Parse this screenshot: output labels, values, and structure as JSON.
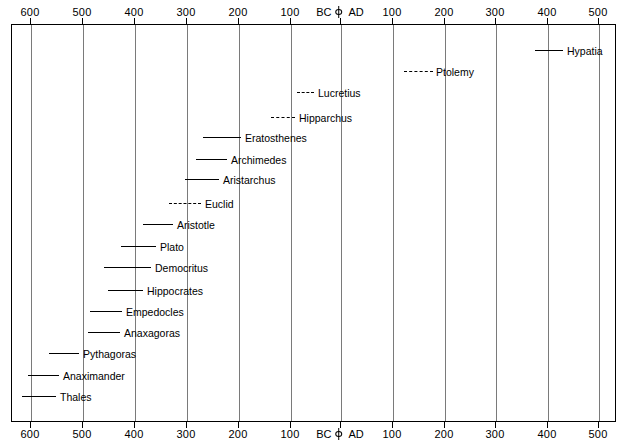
{
  "chart_data": {
    "type": "bar",
    "subtitle": "",
    "xlabel": "",
    "ylabel": "",
    "grid": true,
    "legend": "none",
    "orientation": "horizontal",
    "era_labels": {
      "bc": "BC",
      "ad": "AD",
      "origin_glyph": "origin-marker-icon"
    },
    "axis": {
      "xlim_label_left": "600 BC",
      "xlim_label_right": "500 AD",
      "tick_labels": [
        "600",
        "500",
        "400",
        "300",
        "200",
        "100",
        "BC|AD",
        "100",
        "200",
        "300",
        "400",
        "500"
      ],
      "tick_values": [
        -600,
        -500,
        -400,
        -300,
        -200,
        -100,
        0,
        100,
        200,
        300,
        400,
        500
      ],
      "tick_interval": 100,
      "top_axis": true,
      "bottom_axis": true
    },
    "categories": [
      "Hypatia",
      "Ptolemy",
      "Lucretius",
      "Hipparchus",
      "Eratosthenes",
      "Archimedes",
      "Aristarchus",
      "Euclid",
      "Aristotle",
      "Plato",
      "Democritus",
      "Hippocrates",
      "Empedocles",
      "Anaxagoras",
      "Pythagoras",
      "Anaximander",
      "Thales"
    ],
    "series": [
      {
        "name": "Lifespan / active period",
        "values": [
          {
            "label": "Hypatia",
            "start": 370,
            "end": 415,
            "style": "solid"
          },
          {
            "label": "Ptolemy",
            "start": 115,
            "end": 170,
            "style": "dashed"
          },
          {
            "label": "Lucretius",
            "start": -95,
            "end": -55,
            "style": "dashed"
          },
          {
            "label": "Hipparchus",
            "start": -145,
            "end": -100,
            "style": "dashed"
          },
          {
            "label": "Eratosthenes",
            "start": -276,
            "end": -194,
            "style": "solid"
          },
          {
            "label": "Archimedes",
            "start": -287,
            "end": -212,
            "style": "solid"
          },
          {
            "label": "Aristarchus",
            "start": -310,
            "end": -230,
            "style": "solid"
          },
          {
            "label": "Euclid",
            "start": -340,
            "end": -275,
            "style": "dashed"
          },
          {
            "label": "Aristotle",
            "start": -384,
            "end": -322,
            "style": "solid"
          },
          {
            "label": "Plato",
            "start": -428,
            "end": -348,
            "style": "solid"
          },
          {
            "label": "Democritus",
            "start": -460,
            "end": -370,
            "style": "solid"
          },
          {
            "label": "Hippocrates",
            "start": -460,
            "end": -375,
            "style": "solid"
          },
          {
            "label": "Empedocles",
            "start": -494,
            "end": -434,
            "style": "solid"
          },
          {
            "label": "Anaxagoras",
            "start": -500,
            "end": -428,
            "style": "solid"
          },
          {
            "label": "Pythagoras",
            "start": -570,
            "end": -495,
            "style": "solid"
          },
          {
            "label": "Anaximander",
            "start": -610,
            "end": -546,
            "style": "solid"
          },
          {
            "label": "Thales",
            "start": -624,
            "end": -546,
            "style": "solid"
          }
        ]
      }
    ],
    "colors": {
      "line": "#000000",
      "gridline": "#7a7a7a",
      "frame": "#000000",
      "background": "#ffffff",
      "text": "#000000"
    }
  },
  "rows": [
    {
      "name": "Hypatia",
      "y": 50,
      "x1": 534,
      "x2": 562,
      "label_x": 566,
      "style": "solid"
    },
    {
      "name": "Ptolemy",
      "y": 71,
      "x1": 403,
      "x2": 432,
      "label_x": 435,
      "style": "dashed"
    },
    {
      "name": "Lucretius",
      "y": 92,
      "x1": 296,
      "x2": 313,
      "label_x": 317,
      "style": "dashed"
    },
    {
      "name": "Hipparchus",
      "y": 117,
      "x1": 270,
      "x2": 294,
      "label_x": 298,
      "style": "dashed"
    },
    {
      "name": "Eratosthenes",
      "y": 137,
      "x1": 202,
      "x2": 240,
      "label_x": 244,
      "style": "solid"
    },
    {
      "name": "Archimedes",
      "y": 159,
      "x1": 195,
      "x2": 226,
      "label_x": 230,
      "style": "solid"
    },
    {
      "name": "Aristarchus",
      "y": 179,
      "x1": 184,
      "x2": 218,
      "label_x": 222,
      "style": "solid"
    },
    {
      "name": "Euclid",
      "y": 203,
      "x1": 168,
      "x2": 200,
      "label_x": 204,
      "style": "dashed"
    },
    {
      "name": "Aristotle",
      "y": 224,
      "x1": 142,
      "x2": 172,
      "label_x": 176,
      "style": "solid"
    },
    {
      "name": "Plato",
      "y": 246,
      "x1": 120,
      "x2": 155,
      "label_x": 159,
      "style": "solid"
    },
    {
      "name": "Democritus",
      "y": 267,
      "x1": 103,
      "x2": 150,
      "label_x": 154,
      "style": "solid"
    },
    {
      "name": "Hippocrates",
      "y": 290,
      "x1": 107,
      "x2": 142,
      "label_x": 146,
      "style": "solid"
    },
    {
      "name": "Empedocles",
      "y": 311,
      "x1": 89,
      "x2": 121,
      "label_x": 125,
      "style": "solid"
    },
    {
      "name": "Anaxagoras",
      "y": 332,
      "x1": 87,
      "x2": 119,
      "label_x": 123,
      "style": "solid"
    },
    {
      "name": "Pythagoras",
      "y": 353,
      "x1": 48,
      "x2": 78,
      "label_x": 82,
      "style": "solid"
    },
    {
      "name": "Anaximander",
      "y": 375,
      "x1": 27,
      "x2": 58,
      "label_x": 62,
      "style": "solid"
    },
    {
      "name": "Thales",
      "y": 396,
      "x1": 21,
      "x2": 55,
      "label_x": 59,
      "style": "solid"
    }
  ],
  "ticks": [
    {
      "label": "600",
      "x": 30,
      "kind": "plain"
    },
    {
      "label": "500",
      "x": 82,
      "kind": "plain"
    },
    {
      "label": "400",
      "x": 134,
      "kind": "plain"
    },
    {
      "label": "300",
      "x": 186,
      "kind": "plain"
    },
    {
      "label": "200",
      "x": 238,
      "kind": "plain"
    },
    {
      "label": "100",
      "x": 290,
      "kind": "plain"
    },
    {
      "label": "",
      "x": 340,
      "kind": "origin"
    },
    {
      "label": "100",
      "x": 392,
      "kind": "plain"
    },
    {
      "label": "200",
      "x": 444,
      "kind": "plain"
    },
    {
      "label": "300",
      "x": 495,
      "kind": "plain"
    },
    {
      "label": "400",
      "x": 547,
      "kind": "plain"
    },
    {
      "label": "500",
      "x": 598,
      "kind": "plain"
    }
  ]
}
